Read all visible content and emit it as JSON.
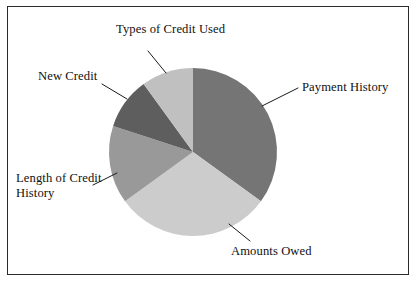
{
  "figure": {
    "background_color": "#ffffff",
    "border_color": "#2b2b2b"
  },
  "chart_data": {
    "type": "pie",
    "title": "",
    "subtitle": "",
    "xlabel": "",
    "ylabel": "",
    "grid": false,
    "legend_position": "none",
    "label_style": "external leader lines",
    "start_angle_deg": 0,
    "direction": "clockwise",
    "center": {
      "x": 193,
      "y": 152
    },
    "radius": 84,
    "categories": [
      "Payment History",
      "Amounts Owed",
      "Length of Credit History",
      "New Credit",
      "Types of Credit Used"
    ],
    "values": [
      35,
      30,
      15,
      10,
      10
    ],
    "value_unit": "percent",
    "slices": [
      {
        "label": "Payment History",
        "value": 35,
        "color": "#757575",
        "start_deg": 0,
        "end_deg": 126
      },
      {
        "label": "Amounts Owed",
        "value": 30,
        "color": "#cccccc",
        "start_deg": 126,
        "end_deg": 234
      },
      {
        "label": "Length of Credit History",
        "value": 15,
        "color": "#999999",
        "start_deg": 234,
        "end_deg": 288
      },
      {
        "label": "New Credit",
        "value": 10,
        "color": "#5e5e5e",
        "start_deg": 288,
        "end_deg": 324
      },
      {
        "label": "Types of Credit Used",
        "value": 10,
        "color": "#c0c0c0",
        "start_deg": 324,
        "end_deg": 360
      }
    ],
    "labels": {
      "types_of_credit_used": "Types of Credit Used",
      "new_credit": "New Credit",
      "length_of_credit_history": "Length of Credit History",
      "amounts_owed": "Amounts Owed",
      "payment_history": "Payment History"
    }
  }
}
